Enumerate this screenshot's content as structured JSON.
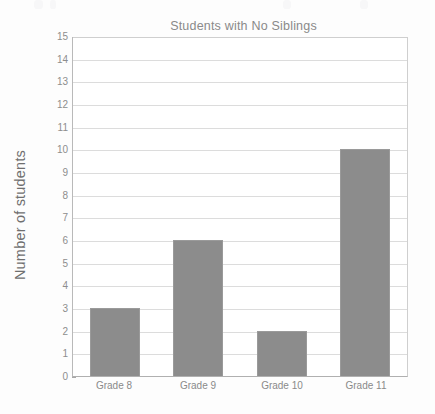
{
  "chart_data": {
    "type": "bar",
    "title": "Students with No Siblings",
    "xlabel": "",
    "ylabel": "Number of students",
    "categories": [
      "Grade 8",
      "Grade 9",
      "Grade 10",
      "Grade 11"
    ],
    "values": [
      3,
      6,
      2,
      10
    ],
    "ylim": [
      0,
      15
    ],
    "ytick_step": 1,
    "yticks": [
      15,
      14,
      13,
      12,
      11,
      10,
      9,
      8,
      7,
      6,
      5,
      4,
      3,
      2,
      1,
      0
    ],
    "grid": true,
    "legend": false,
    "legend_position": "none",
    "bar_color": "#8c8c8c",
    "gridline_color": "#dcdcdc",
    "axis_color": "#b0b0b0",
    "title_color": "#8a8a8a",
    "label_color": "#8a8a8a",
    "background_color": "#fdfdfd"
  }
}
